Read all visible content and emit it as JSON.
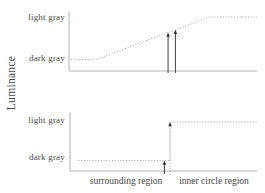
{
  "figure": {
    "ylabel": "Luminance",
    "background": "#ffffff"
  },
  "colors": {
    "axis": "#a9a9a9",
    "curve": "#9d9d9d",
    "arrow": "#2e2e2e",
    "text": "#474747"
  },
  "chart_data": [
    {
      "panel": "top",
      "type": "line",
      "line_style": "dotted",
      "shape": "gradual linear ramp from dark gray up to light gray, flat at both ends",
      "ylabel": "Luminance",
      "y_tick_labels": [
        "light gray",
        "dark gray"
      ],
      "points_norm": [
        [
          0.01,
          0
        ],
        [
          0.144,
          0
        ],
        [
          0.749,
          1
        ],
        [
          1,
          1
        ]
      ],
      "arrows": [
        {
          "x_norm": 0.527,
          "target": "profile",
          "style": "solid",
          "overshoot": 2
        },
        {
          "x_norm": 0.566,
          "target": "profile",
          "style": "solid",
          "overshoot": 2
        }
      ]
    },
    {
      "panel": "bottom",
      "type": "line",
      "line_style": "dotted",
      "shape": "flat at dark gray then abrupt step up to light gray",
      "y_tick_labels": [
        "light gray",
        "dark gray"
      ],
      "x_region_labels": [
        "surrounding region",
        "inner circle region"
      ],
      "points_norm": [
        [
          0.045,
          0
        ],
        [
          0.535,
          0
        ],
        [
          0.535,
          1
        ],
        [
          1,
          1
        ]
      ],
      "arrows": [
        {
          "x_norm": 0.505,
          "target": "dark",
          "style": "solid",
          "overshoot": 3
        },
        {
          "x_norm": 0.535,
          "target": "light",
          "style": "dotted",
          "overshoot": 4
        }
      ]
    }
  ]
}
